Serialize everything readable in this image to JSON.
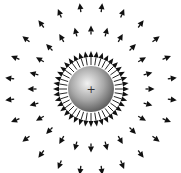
{
  "diagram": {
    "charge": {
      "sign": "+",
      "label": "positive-charge",
      "cx": 91,
      "cy": 89,
      "r": 23
    },
    "field_rings": [
      {
        "name": "inner-ring",
        "count": 40,
        "r_start": 24,
        "r_end": 38,
        "head_len": 6,
        "head_w": 5,
        "offset_deg": 0,
        "style": "line-with-head"
      },
      {
        "name": "middle-ring",
        "count": 24,
        "r_center": 59,
        "length": 9,
        "head_len": 6,
        "head_w": 6,
        "offset_deg": 0,
        "style": "short-arrow"
      },
      {
        "name": "outer-ring",
        "count": 24,
        "r_center": 82,
        "length": 9,
        "head_len": 6,
        "head_w": 6,
        "offset_deg": 7.5,
        "style": "short-arrow"
      }
    ],
    "colors": {
      "arrow": "#111111",
      "sphere_light": "#f2f2f2",
      "sphere_mid": "#a8a8a8",
      "sphere_dark": "#5a5a5a",
      "background": "#ffffff"
    }
  }
}
